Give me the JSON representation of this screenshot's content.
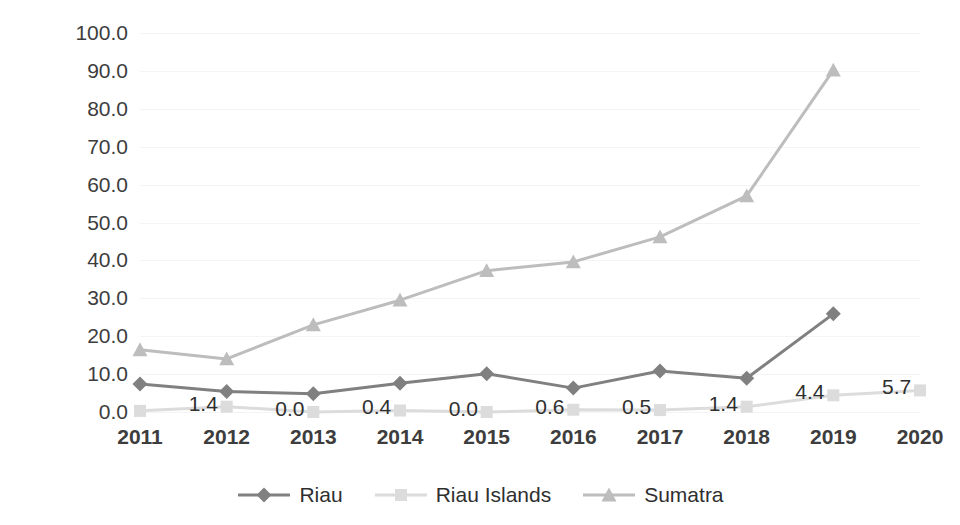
{
  "chart_data": {
    "type": "line",
    "title": "",
    "subtitle": "",
    "xlabel": "",
    "ylabel": "",
    "x": [
      "2011",
      "2012",
      "2013",
      "2014",
      "2015",
      "2016",
      "2017",
      "2018",
      "2019",
      "2020"
    ],
    "categories": [
      "2011",
      "2012",
      "2013",
      "2014",
      "2015",
      "2016",
      "2017",
      "2018",
      "2019",
      "2020"
    ],
    "xlim": [
      2011,
      2020
    ],
    "ylim": [
      0.0,
      100.0
    ],
    "ytick_labels": [
      "100.0",
      "90.0",
      "80.0",
      "70.0",
      "60.0",
      "50.0",
      "40.0",
      "30.0",
      "20.0",
      "10.0",
      "0.0"
    ],
    "ytick_values": [
      100,
      90,
      80,
      70,
      60,
      50,
      40,
      30,
      20,
      10,
      0
    ],
    "grid": true,
    "legend_position": "bottom",
    "series": [
      {
        "name": "Riau",
        "color": "#808080",
        "marker": "diamond",
        "values": [
          7.4,
          5.4,
          4.8,
          7.6,
          10.1,
          6.3,
          10.8,
          8.9,
          25.9,
          null
        ],
        "data_labels": []
      },
      {
        "name": "Riau Islands",
        "color": "#dcdcdc",
        "marker": "square",
        "values": [
          0.3,
          1.4,
          0.0,
          0.4,
          0.0,
          0.6,
          0.5,
          1.4,
          4.4,
          5.7
        ],
        "data_labels": [
          "1.4",
          "0.0",
          "0.4",
          "0.0",
          "0.6",
          "0.5",
          "1.4",
          "4.4",
          "5.7"
        ]
      },
      {
        "name": "Sumatra",
        "color": "#bdbdbd",
        "marker": "triangle",
        "values": [
          16.4,
          14.0,
          23.0,
          29.5,
          37.3,
          39.6,
          46.2,
          57.0,
          90.2,
          null
        ],
        "data_labels": []
      }
    ]
  },
  "legend": {
    "items": [
      {
        "label": "Riau",
        "color": "#808080",
        "marker": "diamond"
      },
      {
        "label": "Riau Islands",
        "color": "#dcdcdc",
        "marker": "square"
      },
      {
        "label": "Sumatra",
        "color": "#bdbdbd",
        "marker": "triangle"
      }
    ]
  },
  "colors": {
    "riau": "#808080",
    "riau_islands": "#dcdcdc",
    "sumatra": "#bdbdbd",
    "text": "#3d3d3d",
    "grid": "#f4f4f4",
    "background": "#ffffff"
  }
}
